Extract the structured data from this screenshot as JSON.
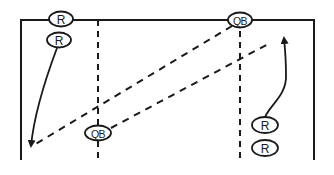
{
  "diagram": {
    "type": "football-play",
    "colors": {
      "stroke": "#1a1a1a",
      "background": "#ffffff"
    },
    "field": {
      "top_y": 20,
      "left_x": 21,
      "right_x": 314,
      "bottom_y": 160
    },
    "dashed_verticals": [
      {
        "x": 98,
        "y1": 20,
        "y2": 160
      },
      {
        "x": 240,
        "y1": 20,
        "y2": 160
      }
    ],
    "players": [
      {
        "id": "r1",
        "label": "R",
        "cx": 61,
        "cy": 19,
        "rx": 12,
        "ry": 7.5
      },
      {
        "id": "r2",
        "label": "R",
        "cx": 59,
        "cy": 40,
        "rx": 12,
        "ry": 7.5
      },
      {
        "id": "qb1",
        "label": "QB",
        "cx": 240,
        "cy": 20,
        "rx": 12,
        "ry": 7.5
      },
      {
        "id": "qb2",
        "label": "QB",
        "cx": 98,
        "cy": 133,
        "rx": 13,
        "ry": 7.5
      },
      {
        "id": "r3",
        "label": "R",
        "cx": 265,
        "cy": 125,
        "rx": 13,
        "ry": 8
      },
      {
        "id": "r4",
        "label": "R",
        "cx": 265,
        "cy": 148,
        "rx": 13,
        "ry": 8
      }
    ],
    "passes": [
      {
        "from": "qb1",
        "x1": 232,
        "y1": 26,
        "x2": 34,
        "y2": 145
      },
      {
        "from": "qb2",
        "x1": 111,
        "y1": 128,
        "x2": 270,
        "y2": 43
      }
    ],
    "routes": [
      {
        "from": "r2",
        "path": "M 57 48 C 45 80, 34 115, 31 146",
        "arrow_tip": [
          31,
          148
        ],
        "arrow_dir": "down"
      },
      {
        "from": "r3",
        "path": "M 265 117 C 270 105, 287 95, 286 75 C 286 60, 285 48, 284 38",
        "arrow_tip": [
          284,
          34
        ],
        "arrow_dir": "up"
      }
    ]
  }
}
